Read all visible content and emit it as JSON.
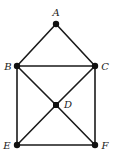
{
  "diagram": {
    "type": "graph",
    "nodes": [
      {
        "id": "A",
        "label": "A",
        "x": 56,
        "y": 24,
        "lx": 56,
        "ly": 16,
        "anchor": "middle"
      },
      {
        "id": "B",
        "label": "B",
        "x": 17,
        "y": 66,
        "lx": 8,
        "ly": 70,
        "anchor": "middle"
      },
      {
        "id": "C",
        "label": "C",
        "x": 95,
        "y": 66,
        "lx": 105,
        "ly": 70,
        "anchor": "middle"
      },
      {
        "id": "D",
        "label": "D",
        "x": 56,
        "y": 105,
        "lx": 68,
        "ly": 108,
        "anchor": "middle"
      },
      {
        "id": "E",
        "label": "E",
        "x": 17,
        "y": 145,
        "lx": 7,
        "ly": 149,
        "anchor": "middle"
      },
      {
        "id": "F",
        "label": "F",
        "x": 95,
        "y": 145,
        "lx": 105,
        "ly": 149,
        "anchor": "middle"
      }
    ],
    "edges": [
      [
        "A",
        "B"
      ],
      [
        "A",
        "C"
      ],
      [
        "B",
        "C"
      ],
      [
        "B",
        "E"
      ],
      [
        "C",
        "F"
      ],
      [
        "E",
        "F"
      ],
      [
        "B",
        "D"
      ],
      [
        "D",
        "F"
      ],
      [
        "C",
        "D"
      ],
      [
        "D",
        "E"
      ]
    ],
    "colors": {
      "edge": "#1a1a1a",
      "node": "#111111",
      "label": "#222222"
    }
  }
}
